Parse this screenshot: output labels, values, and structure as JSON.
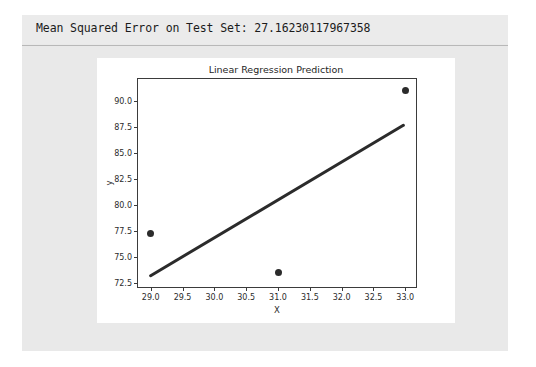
{
  "output": {
    "header_text": "Mean Squared Error on Test Set: 27.16230117967358",
    "metric_name": "Mean Squared Error on Test Set",
    "metric_value": "27.16230117967358"
  },
  "colors": {
    "page_panel": "#e9e9e9",
    "figure_background": "#ffffff",
    "line": "#2b2b2b",
    "marker": "#2b2b2b",
    "axis": "#3b3b3b",
    "divider": "#b8b8b8"
  },
  "chart_data": {
    "type": "scatter",
    "title": "Linear Regression Prediction",
    "xlabel": "X",
    "ylabel": "y",
    "xlim": [
      28.8,
      33.2
    ],
    "ylim": [
      71.9,
      92.1
    ],
    "grid": false,
    "legend": null,
    "xticks": [
      "29.0",
      "29.5",
      "30.0",
      "30.5",
      "31.0",
      "31.5",
      "32.0",
      "32.5",
      "33.0"
    ],
    "xtick_values": [
      29.0,
      29.5,
      30.0,
      30.5,
      31.0,
      31.5,
      32.0,
      32.5,
      33.0
    ],
    "yticks": [
      "72.5",
      "75.0",
      "77.5",
      "80.0",
      "82.5",
      "85.0",
      "87.5",
      "90.0"
    ],
    "ytick_values": [
      72.5,
      75.0,
      77.5,
      80.0,
      82.5,
      85.0,
      87.5,
      90.0
    ],
    "series": [
      {
        "name": "Actual test points",
        "type": "scatter",
        "x": [
          29.0,
          31.0,
          33.0
        ],
        "y": [
          77.2,
          73.5,
          91.0
        ]
      },
      {
        "name": "Regression prediction",
        "type": "line",
        "x": [
          29.0,
          33.0
        ],
        "y": [
          73.0,
          87.6
        ]
      }
    ]
  }
}
